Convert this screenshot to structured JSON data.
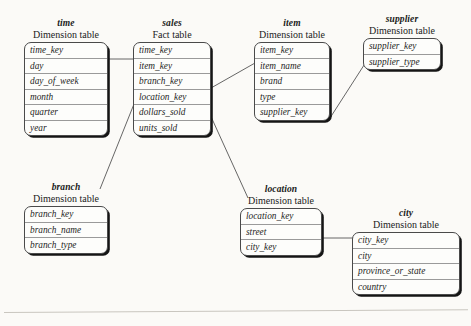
{
  "diagram": {
    "type": "snowflake-schema",
    "subtitle_dimension": "Dimension table",
    "subtitle_fact": "Fact table",
    "tables": {
      "time": {
        "name": "time",
        "kind": "Dimension table",
        "fields": [
          "time_key",
          "day",
          "day_of_week",
          "month",
          "quarter",
          "year"
        ]
      },
      "sales": {
        "name": "sales",
        "kind": "Fact table",
        "fields": [
          "time_key",
          "item_key",
          "branch_key",
          "location_key",
          "dollars_sold",
          "units_sold"
        ]
      },
      "item": {
        "name": "item",
        "kind": "Dimension table",
        "fields": [
          "item_key",
          "item_name",
          "brand",
          "type",
          "supplier_key"
        ]
      },
      "supplier": {
        "name": "supplier",
        "kind": "Dimension table",
        "fields": [
          "supplier_key",
          "supplier_type"
        ]
      },
      "branch": {
        "name": "branch",
        "kind": "Dimension table",
        "fields": [
          "branch_key",
          "branch_name",
          "branch_type"
        ]
      },
      "location": {
        "name": "location",
        "kind": "Dimension table",
        "fields": [
          "location_key",
          "street",
          "city_key"
        ]
      },
      "city": {
        "name": "city",
        "kind": "Dimension table",
        "fields": [
          "city_key",
          "city",
          "province_or_state",
          "country"
        ]
      }
    },
    "relationships": [
      {
        "from": "time",
        "to": "sales",
        "on": "time_key"
      },
      {
        "from": "sales",
        "to": "item",
        "on": "item_key"
      },
      {
        "from": "item",
        "to": "supplier",
        "on": "supplier_key"
      },
      {
        "from": "sales",
        "to": "branch",
        "on": "branch_key"
      },
      {
        "from": "sales",
        "to": "location",
        "on": "location_key"
      },
      {
        "from": "location",
        "to": "city",
        "on": "city_key"
      }
    ],
    "colors": {
      "background": "#fbfaf7",
      "box_fill": "#fdfdfb",
      "box_border": "#4a4a4a",
      "row_divider": "#9a9a9a",
      "shadow": "#151515",
      "link_line": "#555555",
      "text": "#1a1a1a"
    }
  }
}
